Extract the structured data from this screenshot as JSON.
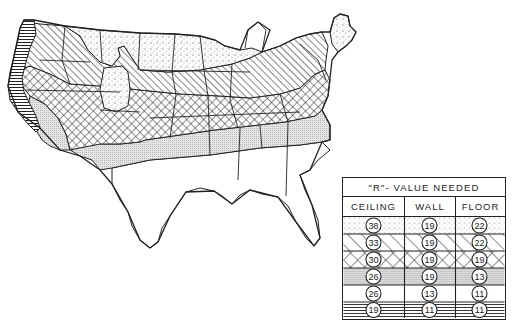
{
  "figure": {
    "type": "insulation zone map",
    "region": "Contiguous United States",
    "ink_color": "#222222",
    "background_color": "#ffffff"
  },
  "legend": {
    "title": "\"R\"- VALUE NEEDED",
    "columns": [
      "CEILING",
      "WALL",
      "FLOOR"
    ],
    "rows": [
      {
        "pattern": "stipple-dots",
        "ceiling": "38",
        "wall": "19",
        "floor": "22"
      },
      {
        "pattern": "diagonal-hatch",
        "ceiling": "33",
        "wall": "19",
        "floor": "22"
      },
      {
        "pattern": "cross-hatch",
        "ceiling": "30",
        "wall": "19",
        "floor": "19"
      },
      {
        "pattern": "gray-screen",
        "ceiling": "26",
        "wall": "19",
        "floor": "13"
      },
      {
        "pattern": "blank",
        "ceiling": "26",
        "wall": "13",
        "floor": "11"
      },
      {
        "pattern": "horizontal-lines",
        "ceiling": "19",
        "wall": "11",
        "floor": "11"
      }
    ]
  },
  "zones": [
    {
      "id": "zone-1",
      "pattern": "stipple-dots",
      "area": "Northern plains, upper Midwest, northern Rockies, northern New England"
    },
    {
      "id": "zone-2",
      "pattern": "diagonal-hatch",
      "area": "Pacific Northwest interior, Great Basin, central plains, Great Lakes, Northeast"
    },
    {
      "id": "zone-3",
      "pattern": "cross-hatch",
      "area": "Mid-latitude band: southern plains, Ohio valley, mid-Atlantic, northern California interior"
    },
    {
      "id": "zone-4",
      "pattern": "gray-screen",
      "area": "Southern states: Texas, lower South, Carolinas, southern California desert"
    },
    {
      "id": "zone-5",
      "pattern": "blank",
      "area": "Gulf coast, south Texas, Florida"
    },
    {
      "id": "zone-6",
      "pattern": "horizontal-lines",
      "area": "Pacific coast strip"
    }
  ]
}
